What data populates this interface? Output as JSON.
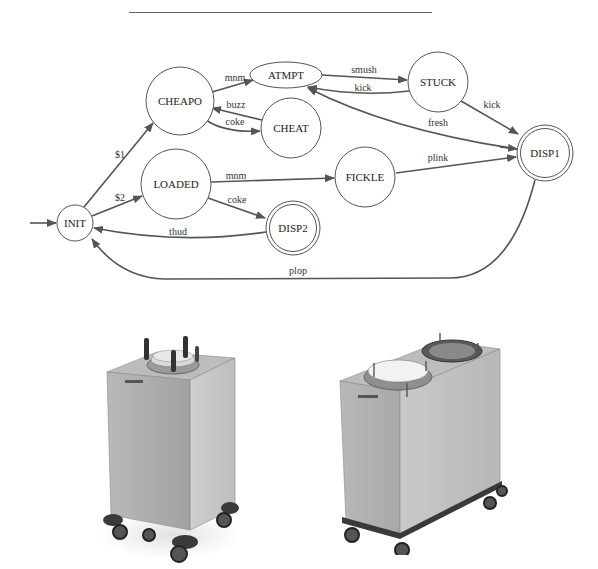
{
  "diagram": {
    "type": "finite-state-machine",
    "start_state": "INIT",
    "states": [
      {
        "id": "INIT",
        "label": "INIT",
        "accepting": false
      },
      {
        "id": "CHEAPO",
        "label": "CHEAPO",
        "accepting": false
      },
      {
        "id": "LOADED",
        "label": "LOADED",
        "accepting": false
      },
      {
        "id": "ATMPT",
        "label": "ATMPT",
        "accepting": false
      },
      {
        "id": "CHEAT",
        "label": "CHEAT",
        "accepting": false
      },
      {
        "id": "STUCK",
        "label": "STUCK",
        "accepting": false
      },
      {
        "id": "FICKLE",
        "label": "FICKLE",
        "accepting": false
      },
      {
        "id": "DISP1",
        "label": "DISP1",
        "accepting": true
      },
      {
        "id": "DISP2",
        "label": "DISP2",
        "accepting": true
      }
    ],
    "transitions": [
      {
        "from": "INIT",
        "to": "CHEAPO",
        "label": "$1"
      },
      {
        "from": "INIT",
        "to": "LOADED",
        "label": "$2"
      },
      {
        "from": "CHEAPO",
        "to": "ATMPT",
        "label": "mnm"
      },
      {
        "from": "CHEAT",
        "to": "CHEAPO",
        "label": "buzz"
      },
      {
        "from": "CHEAPO",
        "to": "CHEAT",
        "label": "coke"
      },
      {
        "from": "ATMPT",
        "to": "STUCK",
        "label": "smush"
      },
      {
        "from": "STUCK",
        "to": "ATMPT",
        "label": "kick"
      },
      {
        "from": "STUCK",
        "to": "DISP1",
        "label": "kick"
      },
      {
        "from": "DISP1",
        "to": "ATMPT",
        "label": "fresh"
      },
      {
        "from": "LOADED",
        "to": "FICKLE",
        "label": "mnm"
      },
      {
        "from": "FICKLE",
        "to": "DISP1",
        "label": "plink"
      },
      {
        "from": "LOADED",
        "to": "DISP2",
        "label": "coke"
      },
      {
        "from": "DISP2",
        "to": "INIT",
        "label": "thud"
      },
      {
        "from": "DISP1",
        "to": "INIT",
        "label": "plop"
      }
    ]
  },
  "photos": [
    {
      "id": "single-dispenser",
      "description": "stainless steel single-well plate dispenser cart on casters"
    },
    {
      "id": "double-dispenser",
      "description": "stainless steel double-well plate dispenser cart on casters"
    }
  ],
  "colors": {
    "line": "#555555",
    "background": "#ffffff",
    "steel_light": "#c9c9c9",
    "steel_dark": "#8a8a8a"
  }
}
